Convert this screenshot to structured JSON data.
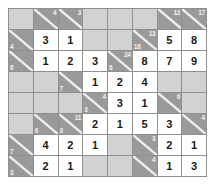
{
  "puzzle": {
    "type": "kakuro",
    "rows": 8,
    "columns": 8,
    "colors": {
      "entry_cell": "#ffffff",
      "clue_cell": "#9a9a9a",
      "blocked_cell": "#d2d2d2",
      "grid_line": "#8f8f8f",
      "digit_text": "#1a1a1a",
      "clue_text": "#f2f2f2"
    },
    "cells": [
      [
        {
          "kind": "blank"
        },
        {
          "kind": "clue",
          "down": "4",
          "across": ""
        },
        {
          "kind": "clue",
          "down": "3",
          "across": ""
        },
        {
          "kind": "blank"
        },
        {
          "kind": "blank"
        },
        {
          "kind": "blank"
        },
        {
          "kind": "clue",
          "down": "12",
          "across": ""
        },
        {
          "kind": "clue",
          "down": "17",
          "across": ""
        }
      ],
      [
        {
          "kind": "clue",
          "down": "",
          "across": "4"
        },
        {
          "kind": "entry",
          "value": "3"
        },
        {
          "kind": "entry",
          "value": "1"
        },
        {
          "kind": "blank"
        },
        {
          "kind": "blank"
        },
        {
          "kind": "clue",
          "down": "13",
          "across": "18"
        },
        {
          "kind": "entry",
          "value": "5"
        },
        {
          "kind": "entry",
          "value": "8"
        }
      ],
      [
        {
          "kind": "clue",
          "down": "",
          "across": "6"
        },
        {
          "kind": "entry",
          "value": "1"
        },
        {
          "kind": "entry",
          "value": "2"
        },
        {
          "kind": "entry",
          "value": "3"
        },
        {
          "kind": "clue",
          "down": "24",
          "across": "6"
        },
        {
          "kind": "entry",
          "value": "8"
        },
        {
          "kind": "entry",
          "value": "7"
        },
        {
          "kind": "entry",
          "value": "9"
        }
      ],
      [
        {
          "kind": "blank"
        },
        {
          "kind": "blank"
        },
        {
          "kind": "clue",
          "down": "",
          "across": "7"
        },
        {
          "kind": "entry",
          "value": "1"
        },
        {
          "kind": "entry",
          "value": "2"
        },
        {
          "kind": "entry",
          "value": "4"
        },
        {
          "kind": "blank"
        },
        {
          "kind": "blank"
        }
      ],
      [
        {
          "kind": "blank"
        },
        {
          "kind": "blank"
        },
        {
          "kind": "blank"
        },
        {
          "kind": "clue",
          "down": "4",
          "across": "3"
        },
        {
          "kind": "entry",
          "value": "3"
        },
        {
          "kind": "entry",
          "value": "1"
        },
        {
          "kind": "clue",
          "down": "6",
          "across": ""
        },
        {
          "kind": "blank"
        }
      ],
      [
        {
          "kind": "blank"
        },
        {
          "kind": "clue",
          "down": "",
          "across": "6"
        },
        {
          "kind": "clue",
          "down": "11",
          "across": "3"
        },
        {
          "kind": "entry",
          "value": "2"
        },
        {
          "kind": "entry",
          "value": "1"
        },
        {
          "kind": "entry",
          "value": "5"
        },
        {
          "kind": "entry",
          "value": "3"
        },
        {
          "kind": "clue",
          "down": "4",
          "across": ""
        }
      ],
      [
        {
          "kind": "clue",
          "down": "",
          "across": "7"
        },
        {
          "kind": "entry",
          "value": "4"
        },
        {
          "kind": "entry",
          "value": "2"
        },
        {
          "kind": "entry",
          "value": "1"
        },
        {
          "kind": "blank"
        },
        {
          "kind": "clue",
          "down": "3",
          "across": ""
        },
        {
          "kind": "entry",
          "value": "2"
        },
        {
          "kind": "entry",
          "value": "1"
        }
      ],
      [
        {
          "kind": "clue",
          "down": "",
          "across": "3"
        },
        {
          "kind": "entry",
          "value": "2"
        },
        {
          "kind": "entry",
          "value": "1"
        },
        {
          "kind": "blank"
        },
        {
          "kind": "blank"
        },
        {
          "kind": "clue",
          "down": "4",
          "across": ""
        },
        {
          "kind": "entry",
          "value": "1"
        },
        {
          "kind": "entry",
          "value": "3"
        }
      ]
    ]
  }
}
